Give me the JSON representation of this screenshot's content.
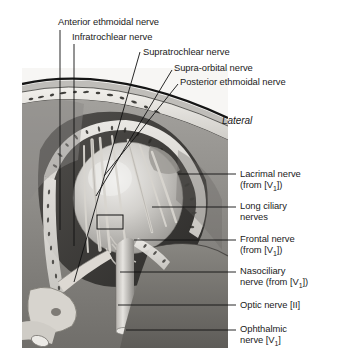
{
  "figure": {
    "orientation_label": "Lateral",
    "colors": {
      "ink": "#1b1b1b",
      "leader": "#111111",
      "bone_light": "#e8e6e2",
      "tissue_mid": "#8d8b88",
      "tissue_dark": "#4a4845",
      "globe_light": "#d9d7d3",
      "nerve_pale": "#cfccc6",
      "background": "#ffffff"
    }
  },
  "labels_top": [
    {
      "id": "anterior-ethmoidal-nerve",
      "text": "Anterior ethmoidal nerve"
    },
    {
      "id": "infratrochlear-nerve",
      "text": "Infratrochlear nerve"
    },
    {
      "id": "supratrochlear-nerve",
      "text": "Supratrochlear nerve"
    },
    {
      "id": "supra-orbital-nerve",
      "text": "Supra-orbital nerve"
    },
    {
      "id": "posterior-ethmoidal-nerve",
      "text": "Posterior ethmoidal nerve"
    }
  ],
  "labels_right": [
    {
      "id": "lacrimal-nerve",
      "name": "Lacrimal nerve",
      "qualifier_pre": "(from [V",
      "qualifier_sub": "1",
      "qualifier_post": "])"
    },
    {
      "id": "long-ciliary-nerves",
      "name_line1": "Long ciliary",
      "name_line2": "nerves"
    },
    {
      "id": "frontal-nerve",
      "name": "Frontal nerve",
      "qualifier_pre": "(from [V",
      "qualifier_sub": "1",
      "qualifier_post": "])"
    },
    {
      "id": "nasociliary-nerve",
      "name_line1": "Nasociliary",
      "name_line2": "nerve",
      "qualifier_pre": " (from [V",
      "qualifier_sub": "1",
      "qualifier_post": "])"
    },
    {
      "id": "optic-nerve",
      "name": "Optic nerve",
      "qualifier_pre": " [II]",
      "qualifier_sub": "",
      "qualifier_post": ""
    },
    {
      "id": "ophthalmic-nerve",
      "name_line1": "Ophthalmic",
      "name_line2": "nerve",
      "qualifier_pre": " [V",
      "qualifier_sub": "1",
      "qualifier_post": "]"
    }
  ]
}
